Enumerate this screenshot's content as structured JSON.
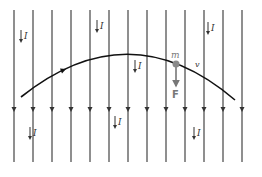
{
  "diagram": {
    "colors": {
      "background": "#ffffff",
      "line": "#333333",
      "trajectory": "#111111",
      "mass": "#8a8a8a",
      "force": "#777777"
    },
    "field_lines": {
      "x_positions": [
        14,
        33,
        52,
        71,
        90,
        109,
        128,
        147,
        166,
        185,
        204,
        223,
        242
      ],
      "y_top": 10,
      "y_bottom": 162,
      "arrow_y": 112,
      "direction": "down"
    },
    "current_labels": [
      {
        "text": "I",
        "x": 24,
        "y": 38
      },
      {
        "text": "I",
        "x": 100,
        "y": 28
      },
      {
        "text": "I",
        "x": 138,
        "y": 68
      },
      {
        "text": "I",
        "x": 211,
        "y": 30
      },
      {
        "text": "I",
        "x": 33,
        "y": 135
      },
      {
        "text": "I",
        "x": 118,
        "y": 124
      },
      {
        "text": "I",
        "x": 197,
        "y": 135
      }
    ],
    "trajectory": {
      "start": [
        21,
        97
      ],
      "control": [
        130,
        10
      ],
      "end": [
        235,
        100
      ],
      "arrow_at": [
        62,
        71
      ]
    },
    "mass": {
      "label": "m",
      "x": 176,
      "y": 64,
      "radius": 3.5
    },
    "force": {
      "label": "F",
      "from_y": 66,
      "to_y": 86
    },
    "velocity": {
      "label": "v",
      "x": 195,
      "y": 67
    }
  }
}
